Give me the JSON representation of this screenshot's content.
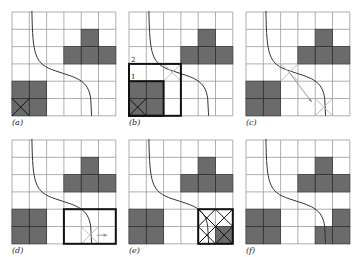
{
  "figure": {
    "grid_size": 6,
    "cell_px": 17.3,
    "colors": {
      "filled": "#6b6b6b",
      "grid": "#9a9a9a",
      "curve": "#333333",
      "bold": "#111111",
      "light": "#bdbdbd"
    },
    "panels": [
      {
        "id": "a",
        "label": "(a)",
        "x": 12,
        "y": 12,
        "filled": [
          [
            4,
            1
          ],
          [
            3,
            2
          ],
          [
            4,
            2
          ],
          [
            5,
            2
          ],
          [
            0,
            4
          ],
          [
            1,
            4
          ],
          [
            0,
            5
          ],
          [
            1,
            5
          ]
        ],
        "crosses": [
          {
            "c": 0,
            "r": 5,
            "color": "dark"
          }
        ],
        "boxes": [],
        "arrows": [],
        "numbers": []
      },
      {
        "id": "b",
        "label": "(b)",
        "x": 129,
        "y": 12,
        "filled": [
          [
            4,
            1
          ],
          [
            3,
            2
          ],
          [
            4,
            2
          ],
          [
            5,
            2
          ],
          [
            0,
            4
          ],
          [
            1,
            4
          ],
          [
            0,
            5
          ],
          [
            1,
            5
          ]
        ],
        "crosses": [
          {
            "c": 0,
            "r": 5,
            "color": "dark"
          },
          {
            "c": 2,
            "r": 3,
            "color": "light"
          }
        ],
        "boxes": [
          {
            "c": 0,
            "r": 3,
            "w": 3,
            "h": 3
          },
          {
            "c": 0,
            "r": 4,
            "w": 2,
            "h": 2
          }
        ],
        "arrows": [],
        "numbers": [
          {
            "text": "2",
            "c": 0,
            "r": 3
          },
          {
            "text": "1",
            "c": 0,
            "r": 4
          }
        ]
      },
      {
        "id": "c",
        "label": "(c)",
        "x": 246,
        "y": 12,
        "filled": [
          [
            4,
            1
          ],
          [
            3,
            2
          ],
          [
            4,
            2
          ],
          [
            5,
            2
          ],
          [
            0,
            4
          ],
          [
            1,
            4
          ],
          [
            0,
            5
          ],
          [
            1,
            5
          ]
        ],
        "crosses": [
          {
            "c": 2,
            "r": 3,
            "color": "light"
          },
          {
            "c": 4,
            "r": 5,
            "color": "light"
          }
        ],
        "boxes": [],
        "arrows": [
          {
            "from": [
              2.5,
              3.5
            ],
            "to": [
              3.8,
              5.2
            ]
          }
        ],
        "numbers": []
      },
      {
        "id": "d",
        "label": "(d)",
        "x": 12,
        "y": 140,
        "filled": [
          [
            4,
            1
          ],
          [
            3,
            2
          ],
          [
            4,
            2
          ],
          [
            5,
            2
          ],
          [
            0,
            4
          ],
          [
            1,
            4
          ],
          [
            0,
            5
          ],
          [
            1,
            5
          ]
        ],
        "crosses": [
          {
            "c": 4,
            "r": 5,
            "color": "light"
          }
        ],
        "boxes": [
          {
            "c": 3,
            "r": 4,
            "w": 3,
            "h": 2
          }
        ],
        "arrows": [
          {
            "from": [
              4.9,
              5.5
            ],
            "to": [
              5.5,
              5.5
            ]
          }
        ],
        "numbers": []
      },
      {
        "id": "e",
        "label": "(e)",
        "x": 129,
        "y": 140,
        "filled": [
          [
            4,
            1
          ],
          [
            3,
            2
          ],
          [
            4,
            2
          ],
          [
            5,
            2
          ],
          [
            0,
            4
          ],
          [
            1,
            4
          ],
          [
            0,
            5
          ],
          [
            1,
            5
          ],
          [
            5,
            5
          ]
        ],
        "crosses": [
          {
            "c": 4,
            "r": 4,
            "color": "dark"
          },
          {
            "c": 5,
            "r": 4,
            "color": "dark"
          },
          {
            "c": 4,
            "r": 5,
            "color": "dark"
          },
          {
            "c": 5,
            "r": 5,
            "color": "dark"
          }
        ],
        "boxes": [
          {
            "c": 4,
            "r": 4,
            "w": 2,
            "h": 2
          }
        ],
        "arrows": [],
        "numbers": []
      },
      {
        "id": "f",
        "label": "(f)",
        "x": 246,
        "y": 140,
        "filled": [
          [
            4,
            1
          ],
          [
            3,
            2
          ],
          [
            4,
            2
          ],
          [
            5,
            2
          ],
          [
            0,
            4
          ],
          [
            1,
            4
          ],
          [
            0,
            5
          ],
          [
            1,
            5
          ],
          [
            5,
            4
          ],
          [
            4,
            5
          ],
          [
            5,
            5
          ]
        ],
        "crosses": [],
        "boxes": [],
        "arrows": [],
        "numbers": []
      }
    ]
  }
}
